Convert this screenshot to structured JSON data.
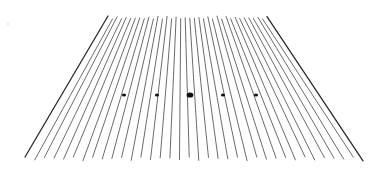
{
  "scene": {
    "description": "Perspective view of many converging strings/lines with fret-position dots",
    "background": "#ffffff",
    "line_color": "#5a5a5a",
    "edge_line_color": "#2a2a2a",
    "line_count": 36,
    "top": {
      "x_start": 108,
      "x_end": 267,
      "y": 16
    },
    "bottom": {
      "x_start": 25,
      "x_end": 363,
      "y": 161
    },
    "dots": [
      {
        "x": 124,
        "y": 95,
        "r": 1.6
      },
      {
        "x": 157,
        "y": 95,
        "r": 1.6
      },
      {
        "x": 190,
        "y": 95,
        "r": 2.6
      },
      {
        "x": 223,
        "y": 95,
        "r": 1.6
      },
      {
        "x": 256,
        "y": 95,
        "r": 1.6
      }
    ],
    "dot_color": "#111111",
    "stray_mark": {
      "x": 8,
      "y": 24
    }
  }
}
